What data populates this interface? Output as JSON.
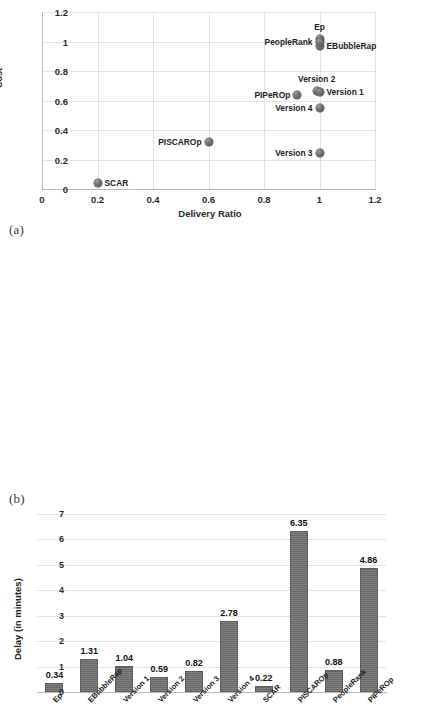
{
  "figures": {
    "a": {
      "caption": "(a)"
    },
    "b": {
      "caption": "(b)"
    }
  },
  "chart_data": [
    {
      "id": "scatter-delivery-cost",
      "type": "scatter",
      "title": "",
      "xlabel": "Delivery Ratio",
      "ylabel": "Cost",
      "xlim": [
        0,
        1.2
      ],
      "ylim": [
        0,
        1.2
      ],
      "xticks": [
        "0",
        "0.2",
        "0.4",
        "0.6",
        "0.8",
        "1",
        "1.2"
      ],
      "yticks": [
        "0",
        "0.2",
        "0.4",
        "0.6",
        "0.8",
        "1",
        "1.2"
      ],
      "grid": true,
      "legend": "none",
      "point_labels_inline": true,
      "points": [
        {
          "label": "Ep",
          "x": 1.0,
          "y": 1.02,
          "label_pos": "top"
        },
        {
          "label": "EBubbleRap",
          "x": 1.0,
          "y": 0.97,
          "label_pos": "right"
        },
        {
          "label": "PeopleRank",
          "x": 1.0,
          "y": 1.0,
          "label_pos": "left"
        },
        {
          "label": "Version 2",
          "x": 0.99,
          "y": 0.665,
          "label_pos": "top"
        },
        {
          "label": "Version 1",
          "x": 1.0,
          "y": 0.66,
          "label_pos": "right"
        },
        {
          "label": "PIPeROp",
          "x": 0.92,
          "y": 0.635,
          "label_pos": "left"
        },
        {
          "label": "Version 4",
          "x": 1.0,
          "y": 0.55,
          "label_pos": "left"
        },
        {
          "label": "PISCAROp",
          "x": 0.6,
          "y": 0.32,
          "label_pos": "left"
        },
        {
          "label": "Version 3",
          "x": 1.0,
          "y": 0.245,
          "label_pos": "left"
        },
        {
          "label": "SCAR",
          "x": 0.2,
          "y": 0.04,
          "label_pos": "right"
        }
      ]
    },
    {
      "id": "bar-delay",
      "type": "bar",
      "title": "",
      "xlabel": "",
      "ylabel": "Delay (in minutes)",
      "ylim": [
        0,
        7
      ],
      "yticks": [
        "0",
        "1",
        "2",
        "3",
        "4",
        "5",
        "6",
        "7"
      ],
      "grid": true,
      "legend": "none",
      "data_labels": true,
      "categories": [
        "Ep",
        "EBubbleRap",
        "Version 1",
        "Version 2",
        "Version 3",
        "Version 4",
        "SCAR",
        "PISCAROp",
        "PeopleRank",
        "PIPeROp"
      ],
      "values": [
        0.34,
        1.31,
        1.04,
        0.59,
        0.82,
        2.78,
        0.22,
        6.35,
        0.88,
        4.86
      ],
      "value_labels": [
        "0.34",
        "1.31",
        "1.04",
        "0.59",
        "0.82",
        "2.78",
        "0.22",
        "6.35",
        "0.88",
        "4.86"
      ],
      "bar_color": "#6e6e6e"
    }
  ]
}
